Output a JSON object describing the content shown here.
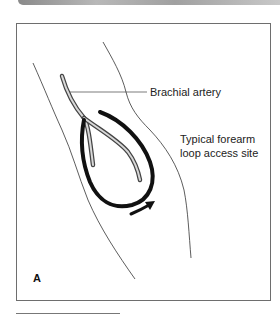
{
  "figure": {
    "panel_letter": "A",
    "labels": {
      "brachial": "Brachial artery",
      "site_line1": "Typical forearm",
      "site_line2": "loop access site"
    },
    "colors": {
      "outline": "#333333",
      "loop": "#111111",
      "artery_light": "#cfcfcf",
      "artery_dark": "#555555",
      "frame": "#6e6e6e"
    }
  }
}
